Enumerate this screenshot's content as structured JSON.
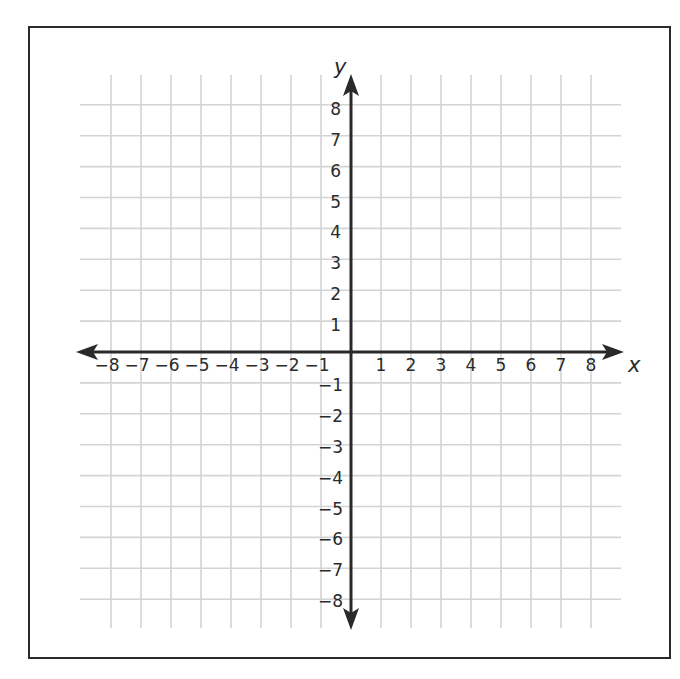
{
  "diagram": {
    "type": "coordinate-plane",
    "x_axis_label": "x",
    "y_axis_label": "y",
    "x_range": [
      -8,
      8
    ],
    "y_range": [
      -8,
      8
    ],
    "grid": true,
    "x_ticks": [
      "−8",
      "−7",
      "−6",
      "−5",
      "−4",
      "−3",
      "−2",
      "−1",
      "1",
      "2",
      "3",
      "4",
      "5",
      "6",
      "7",
      "8"
    ],
    "y_ticks_positive": [
      "1",
      "2",
      "3",
      "4",
      "5",
      "6",
      "7",
      "8"
    ],
    "y_ticks_negative": [
      "−1",
      "−2",
      "−3",
      "−4",
      "−5",
      "−6",
      "−7",
      "−8"
    ],
    "colors": {
      "axis": "#2a2a2a",
      "grid": "#d4d4d4",
      "border": "#2a2a2a"
    }
  }
}
